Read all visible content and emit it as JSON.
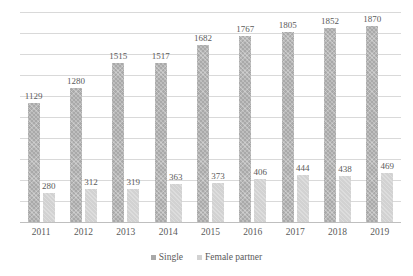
{
  "chart_data": {
    "type": "bar",
    "title": "",
    "subtitle": "",
    "xlabel": "",
    "ylabel": "",
    "categories": [
      "2011",
      "2012",
      "2013",
      "2014",
      "2015",
      "2016",
      "2017",
      "2018",
      "2019"
    ],
    "series": [
      {
        "name": "Single",
        "color": "#a9a9a9",
        "values": [
          1129,
          1280,
          1515,
          1517,
          1682,
          1767,
          1805,
          1852,
          1870
        ]
      },
      {
        "name": "Female partner",
        "color": "#d2d2d2",
        "values": [
          280,
          312,
          319,
          363,
          373,
          406,
          444,
          438,
          469
        ]
      }
    ],
    "ylim": [
      0,
      2000
    ],
    "gridlines": [
      0,
      200,
      400,
      600,
      800,
      1000,
      1200,
      1400,
      1600,
      1800,
      2000
    ],
    "grid": true,
    "data_labels": true,
    "legend_position": "bottom"
  },
  "legend": {
    "items": [
      {
        "label": "Single",
        "swatch": "single"
      },
      {
        "label": "Female partner",
        "swatch": "female"
      }
    ]
  },
  "colors": {
    "single_bar": "#a9a9a9",
    "female_bar": "#d2d2d2",
    "gridline": "#d9d9d9",
    "baseline": "#bfbfbf",
    "text": "#5a5a5a",
    "background": "#ffffff"
  }
}
